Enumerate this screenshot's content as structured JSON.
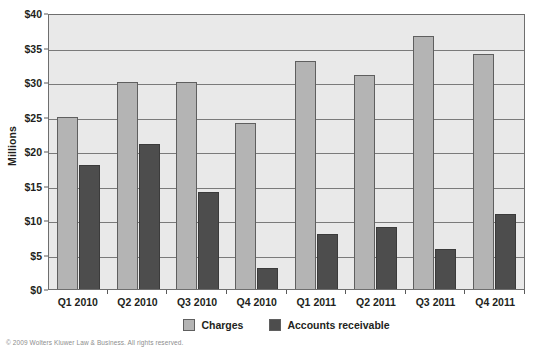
{
  "chart_data": {
    "type": "bar",
    "title": "",
    "subtitle": "",
    "xlabel": "",
    "ylabel": "Millions",
    "ylim": [
      0,
      40
    ],
    "ytick_labels": [
      "$0",
      "$5",
      "$10",
      "$15",
      "$20",
      "$25",
      "$30",
      "$35",
      "$40"
    ],
    "ytick_values": [
      0,
      5,
      10,
      15,
      20,
      25,
      30,
      35,
      40
    ],
    "grid": true,
    "legend_position": "bottom",
    "categories": [
      "Q1 2010",
      "Q2 2010",
      "Q3 2010",
      "Q4 2010",
      "Q1 2011",
      "Q2 2011",
      "Q3 2011",
      "Q4 2011"
    ],
    "series": [
      {
        "name": "Charges",
        "color": "#b4b4b4",
        "values": [
          25,
          30,
          30,
          24,
          33,
          31,
          36.7,
          34
        ]
      },
      {
        "name": "Accounts receivable",
        "color": "#4d4d4d",
        "values": [
          18,
          21,
          14,
          3,
          8,
          9,
          5.8,
          10.8
        ]
      }
    ]
  },
  "legend": {
    "entries": [
      {
        "label": "Charges",
        "color": "#b4b4b4"
      },
      {
        "label": "Accounts receivable",
        "color": "#4d4d4d"
      }
    ]
  },
  "footer": {
    "credit": "© 2009 Wolters Kluwer Law & Business. All rights reserved."
  },
  "colors": {
    "plot_background": "#e9e9e9",
    "gridline": "#7a7a7a",
    "axis": "#6e6e6e",
    "text": "#231f20",
    "charges": "#b4b4b4",
    "accounts_receivable": "#4d4d4d"
  }
}
